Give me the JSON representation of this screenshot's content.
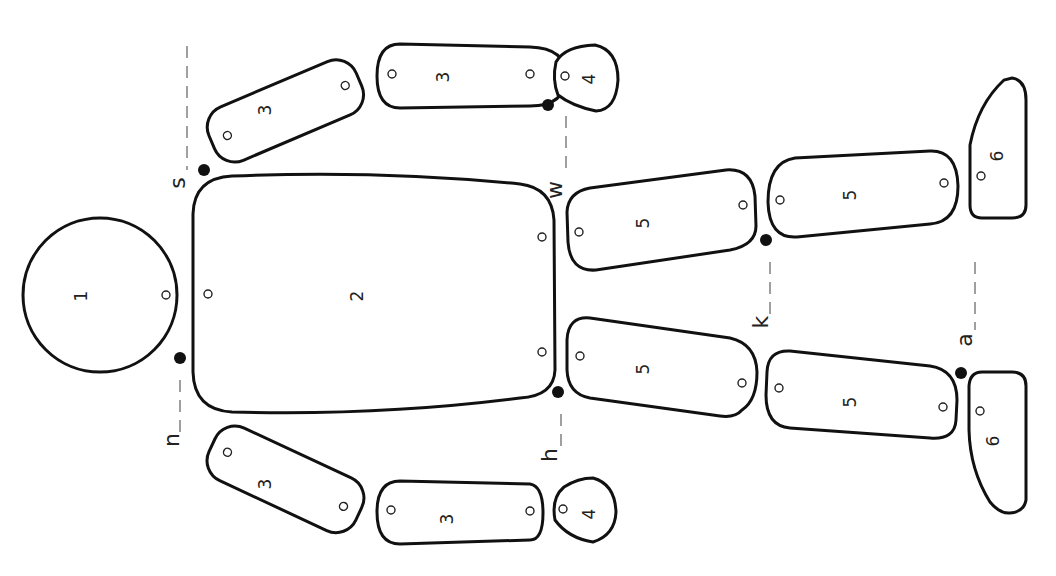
{
  "diagram": {
    "parts": [
      {
        "id": "head",
        "label": "1"
      },
      {
        "id": "torso",
        "label": "2"
      },
      {
        "id": "upper-arm-top",
        "label": "3"
      },
      {
        "id": "forearm-top",
        "label": "3"
      },
      {
        "id": "hand-top",
        "label": "4"
      },
      {
        "id": "upper-arm-bottom",
        "label": "3"
      },
      {
        "id": "forearm-bottom",
        "label": "3"
      },
      {
        "id": "hand-bottom",
        "label": "4"
      },
      {
        "id": "thigh-top",
        "label": "5"
      },
      {
        "id": "shin-top",
        "label": "5"
      },
      {
        "id": "foot-top",
        "label": "6"
      },
      {
        "id": "thigh-bottom",
        "label": "5"
      },
      {
        "id": "shin-bottom",
        "label": "5"
      },
      {
        "id": "foot-bottom",
        "label": "6"
      }
    ],
    "joints": [
      {
        "id": "shoulder-top",
        "label": "s"
      },
      {
        "id": "wrist-top",
        "label": "w"
      },
      {
        "id": "knee-top",
        "label": "k"
      },
      {
        "id": "ankle-bottom",
        "label": "a"
      },
      {
        "id": "neck",
        "label": "n"
      },
      {
        "id": "hip-bottom",
        "label": "h"
      }
    ]
  }
}
